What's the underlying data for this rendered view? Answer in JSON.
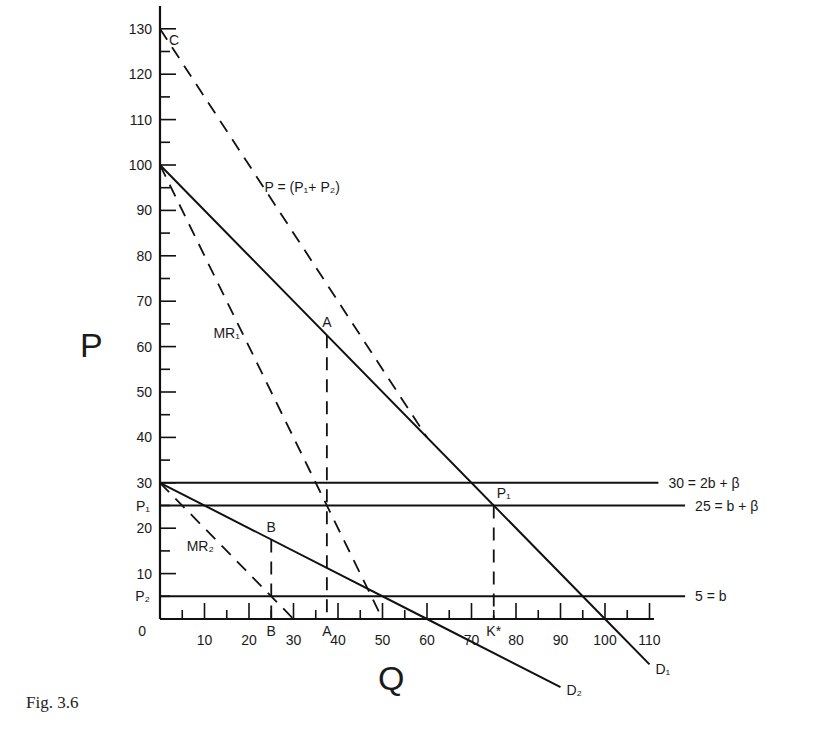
{
  "chart_data": {
    "type": "line",
    "title": "",
    "caption": "Fig.  3.6",
    "xlabel": "Q",
    "ylabel": "P",
    "xlim": [
      0,
      110
    ],
    "ylim": [
      0,
      130
    ],
    "x_ticks": [
      10,
      20,
      30,
      40,
      50,
      60,
      70,
      80,
      90,
      100,
      110
    ],
    "y_ticks": [
      10,
      20,
      30,
      40,
      50,
      60,
      70,
      80,
      90,
      100,
      110,
      120,
      130
    ],
    "origin_label": "0",
    "grid": false,
    "series": [
      {
        "name": "D1",
        "style": "solid",
        "points": [
          [
            0,
            100
          ],
          [
            100,
            0
          ],
          [
            110,
            -10
          ]
        ],
        "label": "D₁"
      },
      {
        "name": "D2",
        "style": "solid",
        "points": [
          [
            0,
            30
          ],
          [
            60,
            0
          ],
          [
            90,
            -15
          ]
        ],
        "label": "D₂"
      },
      {
        "name": "MR1",
        "style": "dashed",
        "points": [
          [
            0,
            100
          ],
          [
            50,
            0
          ]
        ],
        "label": "MR₁"
      },
      {
        "name": "MR2",
        "style": "dashed",
        "points": [
          [
            0,
            30
          ],
          [
            30,
            0
          ]
        ],
        "label": "MR₂"
      },
      {
        "name": "P = (P1 + P2)",
        "style": "dashed",
        "points": [
          [
            0,
            130
          ],
          [
            60,
            40
          ]
        ],
        "label": "P = (P₁+ P₂)"
      },
      {
        "name": "30 = 2b + β",
        "style": "solid",
        "points": [
          [
            0,
            30
          ],
          [
            112,
            30
          ]
        ],
        "label": "30 = 2b + β"
      },
      {
        "name": "25 = b + β",
        "style": "solid",
        "points": [
          [
            0,
            25
          ],
          [
            118,
            25
          ]
        ],
        "label": "25 = b + β"
      },
      {
        "name": "5 = b",
        "style": "solid",
        "points": [
          [
            0,
            5
          ],
          [
            118,
            5
          ]
        ],
        "label": "5 = b"
      },
      {
        "name": "A-drop",
        "style": "dashed",
        "points": [
          [
            37.5,
            62.5
          ],
          [
            37.5,
            0
          ]
        ]
      },
      {
        "name": "B-drop",
        "style": "dashed",
        "points": [
          [
            25,
            17.5
          ],
          [
            25,
            0
          ]
        ]
      },
      {
        "name": "K-drop",
        "style": "dashed",
        "points": [
          [
            75,
            25
          ],
          [
            75,
            0
          ]
        ]
      }
    ],
    "annotations": [
      {
        "text": "C",
        "x": 0,
        "y": 130
      },
      {
        "text": "A",
        "x": 37.5,
        "y": 62.5
      },
      {
        "text": "B",
        "x": 25,
        "y": 17.5
      },
      {
        "text": "P₁",
        "x": 75,
        "y": 25
      },
      {
        "text": "B",
        "x": 25,
        "y": 0,
        "axis": "x"
      },
      {
        "text": "A",
        "x": 37.5,
        "y": 0,
        "axis": "x"
      },
      {
        "text": "K*",
        "x": 75,
        "y": 0,
        "axis": "x"
      },
      {
        "text": "P₁",
        "x": 0,
        "y": 25,
        "axis": "y"
      },
      {
        "text": "P₂",
        "x": 0,
        "y": 5,
        "axis": "y"
      }
    ]
  },
  "labels": {
    "caption": "Fig.  3.6",
    "x_axis": "Q",
    "y_axis": "P"
  }
}
